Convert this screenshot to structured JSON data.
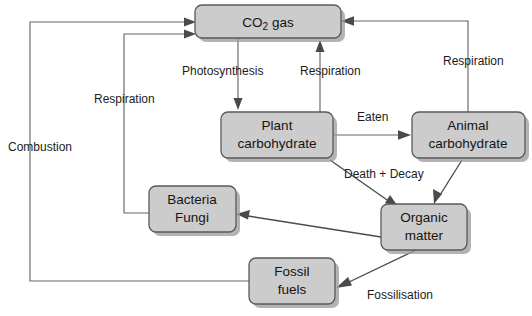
{
  "diagram": {
    "background_color": "#ffffff",
    "box_fill_color": "#cccccc",
    "box_stroke_color": "#5a5a5a",
    "line_color": "#666666",
    "text_color": "#141414"
  },
  "nodes": [
    {
      "id": "co2-gas",
      "label": "CO2 gas",
      "label_main": "CO",
      "label_sub": "2",
      "label_tail": " gas",
      "x": 195,
      "y": 5,
      "w": 146,
      "h": 33
    },
    {
      "id": "plant-carbohydrate",
      "label": "Plant carbohydrate",
      "line1": "Plant",
      "line2": "carbohydrate",
      "x": 221,
      "y": 112,
      "w": 112,
      "h": 46
    },
    {
      "id": "animal-carbohydrate",
      "label": "Animal carbohydrate",
      "line1": "Animal",
      "line2": "carbohydrate",
      "x": 412,
      "y": 112,
      "w": 113,
      "h": 46
    },
    {
      "id": "bacteria-fungi",
      "label": "Bacteria Fungi",
      "line1": "Bacteria",
      "line2": "Fungi",
      "x": 149,
      "y": 186,
      "w": 87,
      "h": 46
    },
    {
      "id": "organic-matter",
      "label": "Organic matter",
      "line1": "Organic",
      "line2": "matter",
      "x": 381,
      "y": 204,
      "w": 86,
      "h": 46
    },
    {
      "id": "fossil-fuels",
      "label": "Fossil fuels",
      "line1": "Fossil",
      "line2": "fuels",
      "x": 249,
      "y": 258,
      "w": 86,
      "h": 46
    }
  ],
  "edge_labels": [
    {
      "id": "photosynthesis",
      "text": "Photosynthesis",
      "x": 182,
      "y": 72,
      "anchor": "start"
    },
    {
      "id": "respiration-plant",
      "text": "Respiration",
      "x": 300,
      "y": 72,
      "anchor": "start"
    },
    {
      "id": "respiration-animal",
      "text": "Respiration",
      "x": 443,
      "y": 62,
      "anchor": "start"
    },
    {
      "id": "respiration-bacteria",
      "text": "Respiration",
      "x": 94,
      "y": 100,
      "anchor": "start"
    },
    {
      "id": "combustion",
      "text": "Combustion",
      "x": 8,
      "y": 148,
      "anchor": "start"
    },
    {
      "id": "eaten",
      "text": "Eaten",
      "x": 357,
      "y": 118,
      "anchor": "start"
    },
    {
      "id": "death-decay",
      "text": "Death + Decay",
      "x": 344,
      "y": 175,
      "anchor": "start"
    },
    {
      "id": "fossilisation",
      "text": "Fossilisation",
      "x": 367,
      "y": 296,
      "anchor": "start"
    }
  ],
  "flows": [
    {
      "id": "flow-photosynthesis",
      "from": "co2-gas",
      "to": "plant-carbohydrate",
      "label": "Photosynthesis"
    },
    {
      "id": "flow-respiration-plant",
      "from": "plant-carbohydrate",
      "to": "co2-gas",
      "label": "Respiration"
    },
    {
      "id": "flow-eaten",
      "from": "plant-carbohydrate",
      "to": "animal-carbohydrate",
      "label": "Eaten"
    },
    {
      "id": "flow-respiration-animal",
      "from": "animal-carbohydrate",
      "to": "co2-gas",
      "label": "Respiration"
    },
    {
      "id": "flow-death-decay-plant",
      "from": "plant-carbohydrate",
      "to": "organic-matter",
      "label": "Death + Decay"
    },
    {
      "id": "flow-death-decay-animal",
      "from": "animal-carbohydrate",
      "to": "organic-matter",
      "label": "Death + Decay"
    },
    {
      "id": "flow-decompose",
      "from": "organic-matter",
      "to": "bacteria-fungi",
      "label": ""
    },
    {
      "id": "flow-respiration-bacteria",
      "from": "bacteria-fungi",
      "to": "co2-gas",
      "label": "Respiration"
    },
    {
      "id": "flow-fossilisation",
      "from": "organic-matter",
      "to": "fossil-fuels",
      "label": "Fossilisation"
    },
    {
      "id": "flow-combustion",
      "from": "fossil-fuels",
      "to": "co2-gas",
      "label": "Combustion"
    }
  ]
}
